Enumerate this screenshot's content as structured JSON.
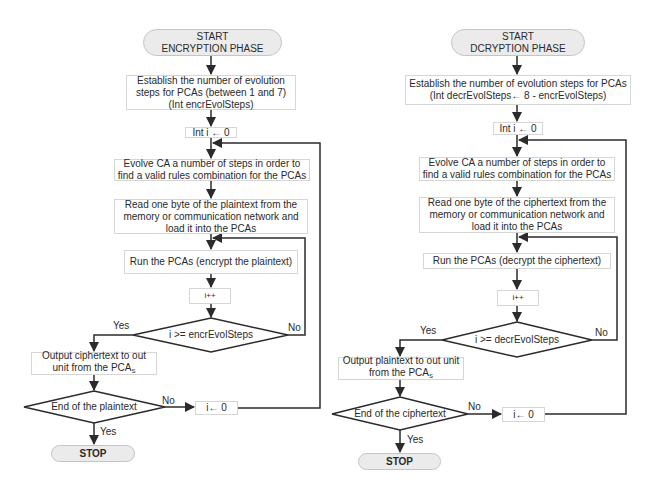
{
  "encryption": {
    "start": "START\nENCRYPTION PHASE",
    "establish": "Establish the number of evolution\nsteps for PCAs (between 1 and 7)\n(Int encrEvolSteps)",
    "init_i": "Int i ←  0",
    "evolve": "Evolve CA a number of steps in order to\nfind a valid rules combination for the PCAs",
    "read": "Read one byte of the plaintext from the\nmemory or communication network and\nload it into the PCAs",
    "run": "Run the PCAs (encrypt the plaintext)",
    "increment": "i++",
    "loop_condition": "i >= encrEvolSteps",
    "loop_yes": "Yes",
    "loop_no": "No",
    "output_line1": "Output ciphertext to out",
    "output_line2": "unit from the PCA",
    "output_sub": "S",
    "end_condition": "End of the plaintext",
    "end_yes": "Yes",
    "end_no": "No",
    "reset_i": "i← 0",
    "stop": "STOP"
  },
  "decryption": {
    "start": "START\nDCRYPTION PHASE",
    "establish": "Establish the number of evolution steps for PCAs\n(Int decrEvolSteps← 8 - encrEvolSteps)",
    "init_i": "Int i ←  0",
    "evolve": "Evolve CA a number of steps in order to\nfind a valid rules combination for the PCAs",
    "read": "Read one byte of the ciphertext from the\nmemory or communication network and\nload it into the PCAs",
    "run": "Run the PCAs (decrypt the ciphertext)",
    "increment": "i++",
    "loop_condition": "i >= decrEvolSteps",
    "loop_yes": "Yes",
    "loop_no": "No",
    "output_line1": "Output plaintext to out unit",
    "output_line2": "from the PCA",
    "output_sub": "S",
    "end_condition": "End of the ciphertext",
    "end_yes": "Yes",
    "end_no": "No",
    "reset_i": "i← 0",
    "stop": "STOP"
  },
  "colors": {
    "line": "#2b2b2b",
    "terminal_fill": "#ebebeb",
    "box_border": "#d6d6d6"
  }
}
